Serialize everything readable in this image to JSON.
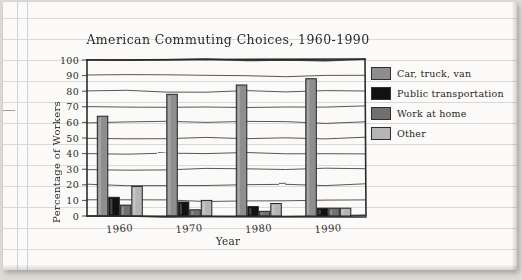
{
  "chart_data": {
    "type": "bar",
    "title": "American Commuting Choices, 1960-1990",
    "xlabel": "Year",
    "ylabel": "Percentage of Workers",
    "categories": [
      "1960",
      "1970",
      "1980",
      "1990"
    ],
    "ylim": [
      0,
      100
    ],
    "yticks": [
      "0",
      "10",
      "20",
      "30",
      "40",
      "50",
      "60",
      "70",
      "80",
      "90",
      "100"
    ],
    "grid": true,
    "legend_position": "right",
    "series": [
      {
        "name": "Car, truck, van",
        "color": "#8e8e8e",
        "values": [
          64,
          78,
          84,
          88
        ]
      },
      {
        "name": "Public transportation",
        "color": "#111111",
        "values": [
          12,
          9,
          6,
          5
        ]
      },
      {
        "name": "Work at home",
        "color": "#707070",
        "values": [
          7,
          4,
          3,
          5
        ]
      },
      {
        "name": "Other",
        "color": "#b5b5b5",
        "values": [
          19,
          10,
          8,
          5
        ]
      }
    ]
  },
  "page": {
    "media": "ruled-notebook-paper"
  }
}
